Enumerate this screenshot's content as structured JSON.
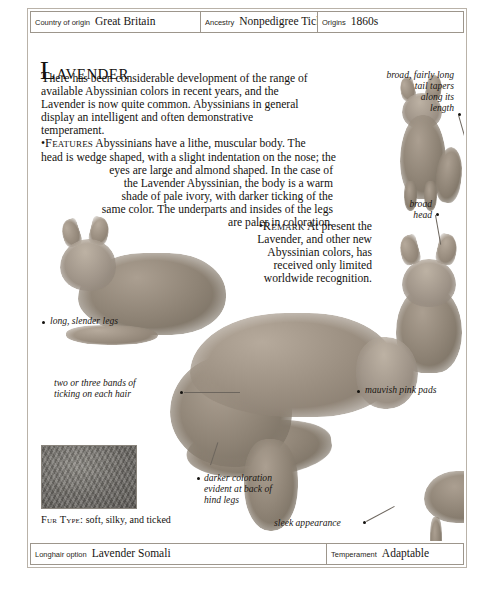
{
  "header": {
    "fields": [
      {
        "label": "Country of origin",
        "value": "Great Britain"
      },
      {
        "label": "Ancestry",
        "value": "Nonpedigree Ticked Shorthairs"
      },
      {
        "label": "Origins",
        "value": "1860s"
      }
    ]
  },
  "footer": {
    "fields": [
      {
        "label": "Longhair option",
        "value": "Lavender Somali"
      },
      {
        "label": "Temperament",
        "value": "Adaptable"
      }
    ]
  },
  "article": {
    "headline_drop": "L",
    "headline_rest": "avender",
    "intro_drop": "T",
    "intro_line1": "here has been considerable development of the range of",
    "intro_line2": "available Abyssinian colors in recent years, and the",
    "intro_line3": "Lavender is now quite common. Abyssinians in general",
    "intro_line4": "display an intelligent and often demonstrative temperament.",
    "features_bullet": "•",
    "features_heading": "Features",
    "features_line1": " Abyssinians have a lithe, muscular body. The",
    "features_line2": "head is wedge shaped, with a slight indentation on the nose; the",
    "features_line3": "eyes are large and almond shaped. In the case of",
    "features_line4": "the Lavender Abyssinian, the body is a warm",
    "features_line5": "shade of pale ivory, with darker ticking of the",
    "features_line6": "same color. The underparts and insides of the legs",
    "features_line7": "are paler in coloration.",
    "remark_bullet": "•",
    "remark_heading": "Remark",
    "remark_line1": " At present the",
    "remark_line2": "Lavender, and other new",
    "remark_line3": "Abyssinian colors, has",
    "remark_line4": "received only limited",
    "remark_line5": "worldwide recognition."
  },
  "annotations": [
    {
      "id": "tail",
      "text": "broad, fairly long\ntail tapers\nalong its\nlength"
    },
    {
      "id": "head",
      "text": "broad\nhead"
    },
    {
      "id": "legs",
      "text": "long, slender legs"
    },
    {
      "id": "ticking",
      "text": "two or three bands of\nticking on each hair"
    },
    {
      "id": "pads",
      "text": "mauvish pink pads"
    },
    {
      "id": "darker",
      "text": "darker coloration\nevident at back of\nhind legs"
    },
    {
      "id": "sleek",
      "text": "sleek appearance"
    }
  ],
  "fur_type": {
    "heading": "Fur Type:",
    "text": " soft, silky, and ticked"
  },
  "colors": {
    "page_border": "#b9b2a8",
    "rule": "#9d968c",
    "ink": "#14120f",
    "leader": "#6d665e",
    "fur_mid": "#9b8f81",
    "fur_dark": "#6f6659",
    "swatch": "#6f6c67"
  }
}
